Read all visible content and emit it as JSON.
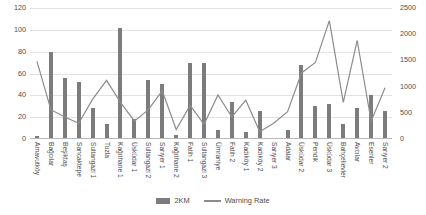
{
  "chart_data": {
    "type": "bar",
    "title": "",
    "subtitle": "",
    "xlabel": "",
    "ylabel": "",
    "grid": true,
    "legend_position": "bottom",
    "categories": [
      "Arnavutköy",
      "Bağcılar",
      "Beşiktaş",
      "Sancaktepe",
      "Sultangazi 1",
      "Tuzla",
      "Kağıthane 1",
      "Üsküdar 1",
      "Sultangazi 2",
      "Sarıyer 1",
      "Kağıthane 2",
      "Fatih 1",
      "Sultangazi 3",
      "Ümraniye",
      "Fatih 2",
      "Kadıköy 1",
      "Kadıköy 2",
      "Sarıyer 3",
      "Adalar",
      "Üsküdar 2",
      "Pendik",
      "Üsküdar 3",
      "Bahçelievler",
      "Avcılar",
      "Esenler",
      "Sarıyer 2"
    ],
    "series": [
      {
        "name": "2KM",
        "type": "bar",
        "axis": "left",
        "color": "#7c7c7c",
        "values": [
          3,
          80,
          56,
          52,
          28,
          14,
          102,
          18,
          54,
          50,
          4,
          70,
          70,
          8,
          34,
          6,
          26,
          1,
          8,
          68,
          30,
          32,
          14,
          28,
          40,
          26
        ]
      },
      {
        "name": "Warning Rate",
        "type": "line",
        "axis": "right",
        "color": "#8c8c8c",
        "values": [
          1480,
          560,
          420,
          300,
          760,
          1120,
          700,
          340,
          560,
          920,
          180,
          640,
          280,
          840,
          420,
          740,
          140,
          300,
          520,
          1260,
          1460,
          2260,
          700,
          1880,
          340,
          980
        ]
      }
    ],
    "left_axis": {
      "ticks": [
        0,
        20,
        40,
        60,
        80,
        100,
        120
      ],
      "ylim": [
        0,
        120
      ]
    },
    "right_axis": {
      "ticks": [
        0,
        500,
        1000,
        1500,
        2000,
        2500
      ],
      "ylim": [
        0,
        2500
      ]
    },
    "legend": [
      {
        "label": "2KM",
        "marker": "bar"
      },
      {
        "label": "Warning Rate",
        "marker": "line"
      }
    ]
  }
}
